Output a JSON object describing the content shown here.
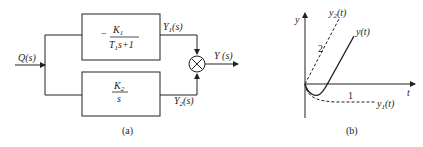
{
  "panel_a": {
    "caption": "(a)",
    "input_label": "Q(s)",
    "output_label": "Y (s)",
    "top_block": {
      "sign": "−",
      "numerator": "K",
      "numerator_sub": "1",
      "denominator_pre": "T",
      "denominator_sub": "1",
      "denominator_post": "s+1"
    },
    "bottom_block": {
      "numerator": "K",
      "numerator_sub": "2",
      "denominator": "s"
    },
    "y1_label": {
      "main": "Y",
      "sub": "1",
      "post": "(s)"
    },
    "y2_label": {
      "main": "Y",
      "sub": "2",
      "post": "(s)"
    },
    "summing_junction": "multiply-sum-junction-icon"
  },
  "panel_b": {
    "caption": "(b)",
    "y_axis_label": "y",
    "t_axis_label": "t",
    "curves": [
      {
        "name": "y2(t)",
        "label_main": "y",
        "label_sub": "2",
        "label_post": "(t)",
        "style": "dashed",
        "slope_label": "2"
      },
      {
        "name": "y(t)",
        "label_main": "y(t)",
        "style": "solid"
      },
      {
        "name": "y1(t)",
        "label_main": "y",
        "label_sub": "1",
        "label_post": "(t)",
        "style": "dashed",
        "asymptote_label": "1"
      }
    ]
  }
}
